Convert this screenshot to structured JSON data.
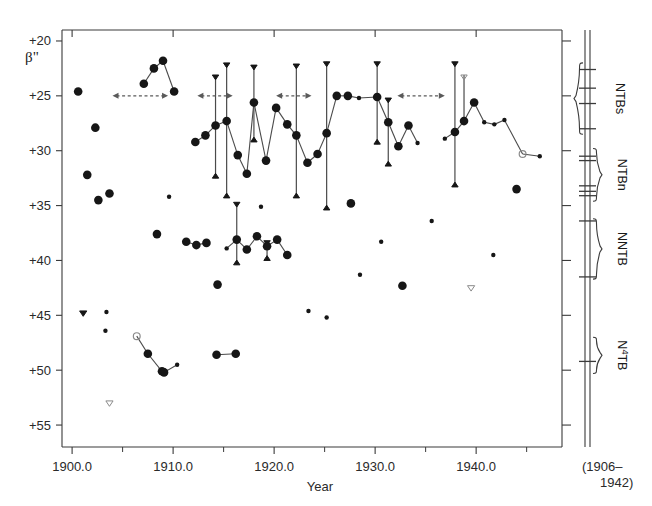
{
  "figure": {
    "axis_labels": {
      "y": "β\"",
      "x": "Year"
    },
    "side_note_line1": "(1906–",
    "side_note_line2": "1942)"
  },
  "chart_data": {
    "type": "scatter",
    "title": "",
    "xlabel": "Year",
    "ylabel": "β\"",
    "xlim": [
      1899.0,
      1948.5
    ],
    "ylim": [
      19.0,
      57.0
    ],
    "y_inverted": true,
    "grid": false,
    "legend": "none",
    "xticks_major": [
      1900.0,
      1910.0,
      1920.0,
      1930.0,
      1940.0
    ],
    "xticklabels": [
      "1900.0",
      "1910.0",
      "1920.0",
      "1930.0",
      "1940.0"
    ],
    "xticks_minor": [
      1905,
      1915,
      1925,
      1935,
      1945
    ],
    "yticks_major": [
      20,
      25,
      30,
      35,
      40,
      45,
      50,
      55
    ],
    "yticklabels": [
      "+20",
      "+25",
      "+30",
      "+35",
      "+40",
      "+45",
      "+50",
      "+55"
    ],
    "marker_legend": [
      {
        "key": "filled-large",
        "desc": "large filled circle — well determined latitude"
      },
      {
        "key": "filled-small",
        "desc": "small filled circle — less certain latitude"
      },
      {
        "key": "open-circle",
        "desc": "open circle — uncertain latitude"
      },
      {
        "key": "filled-triangle-down",
        "desc": "filled down triangle — north edge of belt"
      },
      {
        "key": "filled-triangle-up",
        "desc": "filled up triangle — south edge of belt"
      },
      {
        "key": "open-triangle-down",
        "desc": "open down triangle — uncertain edge"
      }
    ],
    "series": [
      {
        "name": "NTBs",
        "label": "NTBs",
        "band_range_y": [
          21.0,
          29.0
        ],
        "points": [
          {
            "x": 1900.6,
            "y": 24.6,
            "m": "filled-large"
          },
          {
            "x": 1902.3,
            "y": 27.9,
            "m": "filled-large"
          },
          {
            "x": 1907.1,
            "y": 23.9,
            "m": "filled-large",
            "link": 1
          },
          {
            "x": 1908.1,
            "y": 22.5,
            "m": "filled-large",
            "link": 1
          },
          {
            "x": 1909.0,
            "y": 21.8,
            "m": "filled-large",
            "link": 1
          },
          {
            "x": 1910.1,
            "y": 24.6,
            "m": "filled-large",
            "link": 1
          },
          {
            "x": 1912.2,
            "y": 29.2,
            "m": "filled-large",
            "link": 2
          },
          {
            "x": 1913.2,
            "y": 28.6,
            "m": "filled-large",
            "link": 2
          },
          {
            "x": 1914.2,
            "y": 27.7,
            "m": "filled-large",
            "link": 2,
            "err": [
              23.1,
              32.5
            ]
          },
          {
            "x": 1915.3,
            "y": 27.3,
            "m": "filled-large",
            "link": 2,
            "err": [
              22.0,
              34.3
            ]
          },
          {
            "x": 1916.4,
            "y": 30.4,
            "m": "filled-large",
            "link": 2
          },
          {
            "x": 1917.3,
            "y": 32.1,
            "m": "filled-large",
            "link": 2
          },
          {
            "x": 1918.0,
            "y": 25.6,
            "m": "filled-large",
            "link": 2,
            "err": [
              22.2,
              29.2
            ]
          },
          {
            "x": 1919.2,
            "y": 30.9,
            "m": "filled-large",
            "link": 2
          },
          {
            "x": 1920.2,
            "y": 26.1,
            "m": "filled-large",
            "link": 2
          },
          {
            "x": 1921.3,
            "y": 27.6,
            "m": "filled-large",
            "link": 2
          },
          {
            "x": 1922.2,
            "y": 28.6,
            "m": "filled-large",
            "link": 2,
            "err": [
              22.1,
              34.3
            ]
          },
          {
            "x": 1923.3,
            "y": 31.1,
            "m": "filled-large",
            "link": 2
          },
          {
            "x": 1924.3,
            "y": 30.3,
            "m": "filled-large",
            "link": 2
          },
          {
            "x": 1925.2,
            "y": 28.4,
            "m": "filled-large",
            "link": 2,
            "err": [
              21.9,
              35.4
            ]
          },
          {
            "x": 1926.2,
            "y": 25.0,
            "m": "filled-large",
            "link": 2
          },
          {
            "x": 1927.3,
            "y": 25.0,
            "m": "filled-large",
            "link": 2
          },
          {
            "x": 1928.4,
            "y": 25.2,
            "m": "filled-small",
            "link": 2
          },
          {
            "x": 1930.2,
            "y": 25.1,
            "m": "filled-large",
            "link": 2,
            "err": [
              21.9,
              29.4
            ]
          },
          {
            "x": 1931.3,
            "y": 27.4,
            "m": "filled-large",
            "link": 2,
            "err": [
              25.2,
              31.4
            ]
          },
          {
            "x": 1932.3,
            "y": 29.6,
            "m": "filled-large",
            "link": 2
          },
          {
            "x": 1933.3,
            "y": 27.7,
            "m": "filled-large",
            "link": 2
          },
          {
            "x": 1934.2,
            "y": 29.3,
            "m": "filled-small",
            "link": 2
          },
          {
            "x": 1936.9,
            "y": 28.9,
            "m": "filled-small",
            "link": 3
          },
          {
            "x": 1937.9,
            "y": 28.3,
            "m": "filled-large",
            "link": 3,
            "err": [
              21.9,
              33.3
            ]
          },
          {
            "x": 1938.8,
            "y": 27.3,
            "m": "filled-large",
            "link": 3,
            "err": [
              23.1,
              27.6
            ],
            "err_open_top": true
          },
          {
            "x": 1939.8,
            "y": 25.6,
            "m": "filled-large",
            "link": 3
          },
          {
            "x": 1940.8,
            "y": 27.4,
            "m": "filled-small",
            "link": 3
          },
          {
            "x": 1941.8,
            "y": 27.6,
            "m": "filled-small",
            "link": 3
          },
          {
            "x": 1942.8,
            "y": 27.2,
            "m": "filled-small",
            "link": 3
          },
          {
            "x": 1944.6,
            "y": 30.3,
            "m": "open-circle",
            "link": 3
          },
          {
            "x": 1946.3,
            "y": 30.5,
            "m": "filled-small",
            "link": 3
          }
        ]
      },
      {
        "name": "NTBn",
        "label": "NTBn",
        "band_range_y": [
          29.5,
          34.5
        ],
        "points": [
          {
            "x": 1901.5,
            "y": 32.2,
            "m": "filled-large"
          },
          {
            "x": 1902.6,
            "y": 34.5,
            "m": "filled-large"
          },
          {
            "x": 1903.7,
            "y": 33.9,
            "m": "filled-large"
          },
          {
            "x": 1909.6,
            "y": 34.2,
            "m": "filled-small"
          },
          {
            "x": 1918.7,
            "y": 35.1,
            "m": "filled-small"
          },
          {
            "x": 1927.6,
            "y": 34.8,
            "m": "filled-large"
          },
          {
            "x": 1930.6,
            "y": 38.3,
            "m": "filled-small"
          },
          {
            "x": 1935.6,
            "y": 36.4,
            "m": "filled-small"
          },
          {
            "x": 1944.0,
            "y": 33.5,
            "m": "filled-large"
          }
        ]
      },
      {
        "name": "NNTB",
        "label": "NNTB",
        "band_range_y": [
          36.0,
          42.0
        ],
        "points": [
          {
            "x": 1908.4,
            "y": 37.6,
            "m": "filled-large"
          },
          {
            "x": 1911.3,
            "y": 38.3,
            "m": "filled-large",
            "link": 5
          },
          {
            "x": 1912.3,
            "y": 38.6,
            "m": "filled-large",
            "link": 5
          },
          {
            "x": 1913.3,
            "y": 38.4,
            "m": "filled-large",
            "link": 5
          },
          {
            "x": 1915.3,
            "y": 38.9,
            "m": "filled-small",
            "link": 6
          },
          {
            "x": 1916.3,
            "y": 38.1,
            "m": "filled-large",
            "link": 6,
            "err": [
              34.7,
              40.4
            ]
          },
          {
            "x": 1917.3,
            "y": 39.0,
            "m": "filled-large",
            "link": 6
          },
          {
            "x": 1918.3,
            "y": 37.8,
            "m": "filled-large",
            "link": 6
          },
          {
            "x": 1919.3,
            "y": 38.7,
            "m": "filled-large",
            "link": 6,
            "err": [
              38.2,
              40.0
            ]
          },
          {
            "x": 1920.3,
            "y": 38.1,
            "m": "filled-large",
            "link": 6
          },
          {
            "x": 1921.3,
            "y": 39.5,
            "m": "filled-large",
            "link": 6
          },
          {
            "x": 1914.4,
            "y": 42.2,
            "m": "filled-large"
          },
          {
            "x": 1923.4,
            "y": 44.6,
            "m": "filled-small"
          },
          {
            "x": 1925.2,
            "y": 45.2,
            "m": "filled-small"
          },
          {
            "x": 1928.5,
            "y": 41.3,
            "m": "filled-small"
          },
          {
            "x": 1932.7,
            "y": 42.3,
            "m": "filled-large"
          },
          {
            "x": 1939.5,
            "y": 42.3,
            "m": "open-triangle-down"
          },
          {
            "x": 1941.7,
            "y": 39.5,
            "m": "filled-small"
          }
        ]
      },
      {
        "name": "N4TB",
        "label": "N⁴TB",
        "band_range_y": [
          47.5,
          51.0
        ],
        "points": [
          {
            "x": 1901.1,
            "y": 44.6,
            "m": "filled-triangle-down"
          },
          {
            "x": 1903.4,
            "y": 44.7,
            "m": "filled-small"
          },
          {
            "x": 1903.3,
            "y": 46.4,
            "m": "filled-small"
          },
          {
            "x": 1903.7,
            "y": 52.8,
            "m": "open-triangle-down"
          },
          {
            "x": 1906.4,
            "y": 46.9,
            "m": "open-circle",
            "link": 7
          },
          {
            "x": 1907.5,
            "y": 48.5,
            "m": "filled-large",
            "link": 7
          },
          {
            "x": 1908.9,
            "y": 50.1,
            "m": "filled-large",
            "link": 7
          },
          {
            "x": 1909.1,
            "y": 50.2,
            "m": "filled-large",
            "link": 7
          },
          {
            "x": 1910.4,
            "y": 49.5,
            "m": "filled-small",
            "link": 7
          },
          {
            "x": 1914.3,
            "y": 48.6,
            "m": "filled-large",
            "link": 8
          },
          {
            "x": 1916.2,
            "y": 48.5,
            "m": "filled-large",
            "link": 8
          }
        ]
      }
    ],
    "range_arrows": [
      {
        "x_start": 1904.0,
        "x_end": 1909.5,
        "y": 25.0,
        "style": "dashed-double-arrow"
      },
      {
        "x_start": 1912.4,
        "x_end": 1915.9,
        "y": 25.0,
        "style": "dashed-double-arrow"
      },
      {
        "x_start": 1920.2,
        "x_end": 1923.7,
        "y": 25.0,
        "style": "dashed-double-arrow"
      },
      {
        "x_start": 1932.2,
        "x_end": 1936.9,
        "y": 25.0,
        "style": "dashed-double-arrow"
      }
    ],
    "side_panel": {
      "caption_line1": "(1906–",
      "caption_line2": "1942)",
      "brackets": [
        {
          "label": "NTBs",
          "y_top": 22.0,
          "y_bottom": 28.5,
          "ticks": [
            22.6,
            24.3,
            25.7,
            28.0
          ]
        },
        {
          "label": "NTBn",
          "y_top": 29.8,
          "y_bottom": 34.6,
          "ticks": [
            30.5,
            30.9,
            33.2,
            33.7,
            34.1
          ]
        },
        {
          "label": "NNTB",
          "y_top": 36.2,
          "y_bottom": 41.7,
          "ticks": [
            36.4,
            41.5
          ]
        },
        {
          "label": "N⁴TB",
          "y_top": 47.0,
          "y_bottom": 50.3,
          "ticks": [
            49.2
          ]
        }
      ]
    }
  },
  "colors": {
    "axis": "#3a3a3a",
    "marker": "#161616",
    "open_marker": "#8a8a8a",
    "connector": "#4a4a4a",
    "arrow": "#5a5a5a"
  }
}
